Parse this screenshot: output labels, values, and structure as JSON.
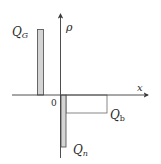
{
  "diagram": {
    "type": "charge-density-distribution",
    "axes": {
      "x_label": "x",
      "y_label": "ρ",
      "origin_label": "0"
    },
    "regions": [
      {
        "id": "QG",
        "label_main": "Q",
        "label_sub": "G",
        "sign": "positive",
        "shape": "narrow-bar",
        "position": "left of origin"
      },
      {
        "id": "Qn",
        "label_main": "Q",
        "label_sub": "n",
        "sign": "negative",
        "shape": "narrow-bar",
        "position": "right of origin"
      },
      {
        "id": "Qb",
        "label_main": "Q",
        "label_sub": "b",
        "sign": "negative",
        "shape": "wide-rectangle",
        "position": "right of origin"
      }
    ],
    "colors": {
      "line": "#3a3a3a",
      "bar_fill": "#d4d4d4",
      "outline": "#5a5a5a"
    }
  }
}
